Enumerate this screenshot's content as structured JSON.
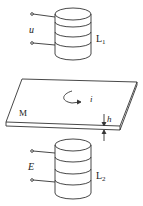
{
  "diagram": {
    "top_coil": {
      "label": "L",
      "subscript": "1",
      "voltage_label": "u"
    },
    "plate": {
      "label": "M",
      "current_label": "i",
      "thickness_label": "h"
    },
    "bottom_coil": {
      "label": "L",
      "subscript": "2",
      "voltage_label": "E"
    }
  },
  "colors": {
    "stroke": "#333333",
    "background": "#ffffff"
  }
}
